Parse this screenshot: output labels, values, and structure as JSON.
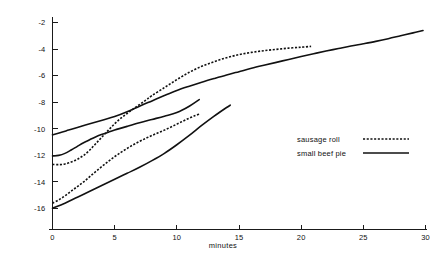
{
  "chart_data": {
    "type": "line",
    "title": "",
    "xlabel": "minutes",
    "ylabel": "",
    "xlim": [
      0,
      30
    ],
    "ylim": [
      -17,
      -1.6
    ],
    "grid": false,
    "legend_position": "right-center",
    "xticks": [
      0,
      5,
      10,
      15,
      20,
      25,
      30
    ],
    "xtick_labels": [
      "0",
      "5",
      "10",
      "15",
      "20",
      "25",
      "30"
    ],
    "yticks": [
      -2,
      -4,
      -6,
      -8,
      -10,
      -12,
      -14,
      -16
    ],
    "ytick_labels": [
      "-2",
      "-4",
      "-6",
      "-8",
      "-10",
      "-12",
      "-14",
      "-16"
    ],
    "legend": [
      {
        "name": "sausage roll",
        "style": "dashed"
      },
      {
        "name": "small beef pie",
        "style": "solid"
      }
    ],
    "series": [
      {
        "name": "small beef pie - upper",
        "style": "solid",
        "points": [
          [
            0,
            -10.45
          ],
          [
            0.6,
            -10.3
          ],
          [
            1.3,
            -10.1
          ],
          [
            2,
            -9.9
          ],
          [
            3,
            -9.62
          ],
          [
            4,
            -9.35
          ],
          [
            5,
            -9.08
          ],
          [
            6,
            -8.72
          ],
          [
            7,
            -8.3
          ],
          [
            8,
            -7.9
          ],
          [
            9,
            -7.5
          ],
          [
            10,
            -7.12
          ],
          [
            11,
            -6.8
          ],
          [
            12,
            -6.5
          ],
          [
            13,
            -6.22
          ],
          [
            14,
            -5.95
          ],
          [
            15,
            -5.7
          ],
          [
            16,
            -5.45
          ],
          [
            17,
            -5.22
          ],
          [
            18,
            -5.0
          ],
          [
            19,
            -4.78
          ],
          [
            20,
            -4.56
          ],
          [
            21,
            -4.35
          ],
          [
            22,
            -4.15
          ],
          [
            23,
            -3.96
          ],
          [
            24,
            -3.77
          ],
          [
            25,
            -3.6
          ],
          [
            26,
            -3.42
          ],
          [
            27,
            -3.22
          ],
          [
            28,
            -3.0
          ],
          [
            29,
            -2.78
          ],
          [
            29.8,
            -2.6
          ]
        ]
      },
      {
        "name": "sausage roll - upper",
        "style": "dashed",
        "points": [
          [
            0,
            -12.68
          ],
          [
            0.5,
            -12.7
          ],
          [
            1,
            -12.65
          ],
          [
            1.5,
            -12.5
          ],
          [
            2,
            -12.3
          ],
          [
            2.5,
            -12.0
          ],
          [
            3,
            -11.6
          ],
          [
            3.5,
            -11.1
          ],
          [
            4,
            -10.6
          ],
          [
            4.5,
            -10.1
          ],
          [
            5,
            -9.62
          ],
          [
            5.5,
            -9.2
          ],
          [
            6,
            -8.85
          ],
          [
            6.5,
            -8.5
          ],
          [
            7,
            -8.18
          ],
          [
            7.5,
            -7.85
          ],
          [
            8,
            -7.5
          ],
          [
            9,
            -6.9
          ],
          [
            10,
            -6.3
          ],
          [
            11,
            -5.75
          ],
          [
            12,
            -5.3
          ],
          [
            13,
            -4.95
          ],
          [
            14,
            -4.65
          ],
          [
            15,
            -4.42
          ],
          [
            16,
            -4.25
          ],
          [
            17,
            -4.12
          ],
          [
            18,
            -4.02
          ],
          [
            19,
            -3.93
          ],
          [
            20,
            -3.86
          ],
          [
            20.8,
            -3.8
          ]
        ]
      },
      {
        "name": "small beef pie - middle",
        "style": "solid",
        "points": [
          [
            0,
            -12.05
          ],
          [
            0.5,
            -12.0
          ],
          [
            1,
            -11.85
          ],
          [
            1.5,
            -11.6
          ],
          [
            2,
            -11.32
          ],
          [
            2.5,
            -11.05
          ],
          [
            3,
            -10.82
          ],
          [
            3.5,
            -10.6
          ],
          [
            4,
            -10.42
          ],
          [
            4.5,
            -10.26
          ],
          [
            5,
            -10.1
          ],
          [
            6,
            -9.82
          ],
          [
            7,
            -9.55
          ],
          [
            8,
            -9.3
          ],
          [
            9,
            -9.05
          ],
          [
            10,
            -8.78
          ],
          [
            11,
            -8.3
          ],
          [
            11.8,
            -7.8
          ]
        ]
      },
      {
        "name": "sausage roll - lower",
        "style": "dashed",
        "points": [
          [
            0,
            -15.6
          ],
          [
            0.5,
            -15.35
          ],
          [
            1,
            -15.05
          ],
          [
            1.5,
            -14.7
          ],
          [
            2,
            -14.35
          ],
          [
            2.5,
            -14.0
          ],
          [
            3,
            -13.6
          ],
          [
            3.5,
            -13.2
          ],
          [
            4,
            -12.82
          ],
          [
            4.5,
            -12.45
          ],
          [
            5,
            -12.1
          ],
          [
            5.5,
            -11.78
          ],
          [
            6,
            -11.48
          ],
          [
            6.5,
            -11.2
          ],
          [
            7,
            -10.95
          ],
          [
            7.5,
            -10.72
          ],
          [
            8,
            -10.5
          ],
          [
            8.5,
            -10.3
          ],
          [
            9,
            -10.1
          ],
          [
            9.5,
            -9.88
          ],
          [
            10,
            -9.65
          ],
          [
            10.5,
            -9.42
          ],
          [
            11,
            -9.2
          ],
          [
            11.5,
            -9.0
          ],
          [
            11.9,
            -8.88
          ]
        ]
      },
      {
        "name": "small beef pie - lower",
        "style": "solid",
        "points": [
          [
            0,
            -15.98
          ],
          [
            1,
            -15.6
          ],
          [
            2,
            -15.15
          ],
          [
            3,
            -14.7
          ],
          [
            4,
            -14.25
          ],
          [
            5,
            -13.8
          ],
          [
            6,
            -13.35
          ],
          [
            7,
            -12.9
          ],
          [
            8,
            -12.4
          ],
          [
            9,
            -11.85
          ],
          [
            10,
            -11.2
          ],
          [
            11,
            -10.5
          ],
          [
            12,
            -9.75
          ],
          [
            13,
            -9.05
          ],
          [
            14,
            -8.4
          ],
          [
            14.3,
            -8.22
          ]
        ]
      }
    ]
  },
  "axes": {
    "x_axis_name": "minutes",
    "y_axis_name": ""
  }
}
